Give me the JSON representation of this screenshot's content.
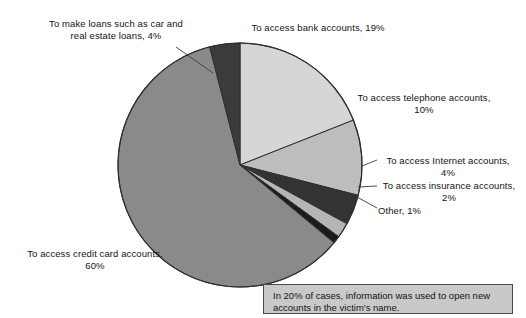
{
  "chart_data": {
    "type": "pie",
    "title": "",
    "xlabel": "",
    "ylabel": "",
    "legend_position": "none",
    "grid": false,
    "unit": "%",
    "categories": [
      "To access bank accounts",
      "To access telephone accounts",
      "To access Internet accounts",
      "To access insurance accounts",
      "Other",
      "To access credit card accounts",
      "To make loans such as car and real estate loans"
    ],
    "values": [
      19,
      10,
      4,
      2,
      1,
      60,
      4
    ],
    "slices": [
      {
        "name": "bank-accounts",
        "label": "To access bank accounts, 19%",
        "value": 19,
        "color": "#d6d6d6"
      },
      {
        "name": "telephone-accounts",
        "label": "To access telephone accounts,\n10%",
        "value": 10,
        "color": "#bdbdbd"
      },
      {
        "name": "internet-accounts",
        "label": "To access Internet accounts,\n4%",
        "value": 4,
        "color": "#333333"
      },
      {
        "name": "insurance-accounts",
        "label": "To access insurance accounts,\n2%",
        "value": 2,
        "color": "#b5b5b5"
      },
      {
        "name": "other",
        "label": "Other, 1%",
        "value": 1,
        "color": "#1c1c1c"
      },
      {
        "name": "credit-card-accounts",
        "label": "To access credit card accounts,\n60%",
        "value": 60,
        "color": "#8a8a8a"
      },
      {
        "name": "loans",
        "label": "To make loans such as car and\nreal estate loans, 4%",
        "value": 4,
        "color": "#3b3b3b"
      }
    ]
  },
  "note": {
    "text": "In 20% of cases, information was used to open new accounts in the victim's name."
  }
}
